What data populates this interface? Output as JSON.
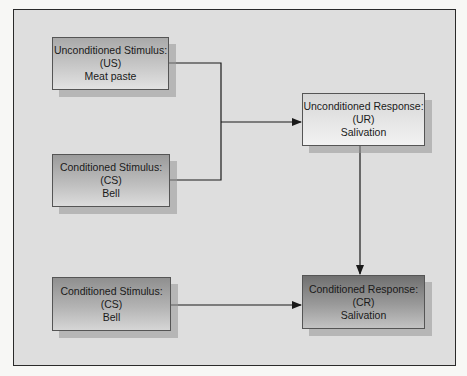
{
  "diagram": {
    "nodes": [
      {
        "id": "us",
        "line1": "Unconditioned Stimulus:",
        "line2": "(US)",
        "line3": "Meat paste"
      },
      {
        "id": "cs1",
        "line1": "Conditioned Stimulus:",
        "line2": "(CS)",
        "line3": "Bell"
      },
      {
        "id": "ur",
        "line1": "Unconditioned Response:",
        "line2": "(UR)",
        "line3": "Salivation"
      },
      {
        "id": "cs2",
        "line1": "Conditioned Stimulus:",
        "line2": "(CS)",
        "line3": "Bell"
      },
      {
        "id": "cr",
        "line1": "Conditioned Response:",
        "line2": "(CR)",
        "line3": "Salivation"
      }
    ],
    "edges": [
      {
        "from": "us",
        "to": "ur",
        "type": "bracket-merge"
      },
      {
        "from": "cs1",
        "to": "ur",
        "type": "bracket-merge"
      },
      {
        "from": "ur",
        "to": "cr",
        "type": "arrow-down"
      },
      {
        "from": "cs2",
        "to": "cr",
        "type": "arrow-right"
      }
    ],
    "colors": {
      "frame_border": "#2a2a2a",
      "frame_background": "#dedede",
      "line": "#1a1a1a",
      "text": "#1a1a1a"
    }
  }
}
